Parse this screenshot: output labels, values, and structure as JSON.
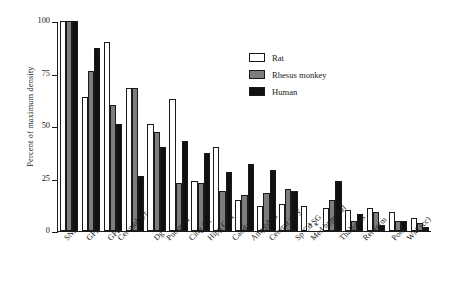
{
  "chart_data": {
    "type": "bar",
    "title": "",
    "xlabel": "",
    "ylabel": "Percent of maximum density",
    "ylim": [
      0,
      100
    ],
    "yticks": [
      0,
      25,
      50,
      75,
      100
    ],
    "grid": false,
    "legend_position": "top-right",
    "missing_marker": "*",
    "categories": [
      "SNr",
      "GPi",
      "GPe",
      "Cer mol lyr",
      "Dg",
      "Putamen",
      "Cing Cx",
      "Hipp CA1",
      "Caudate",
      "Amygdala",
      "Central gray",
      "Sp Cd SG",
      "Med hypothal",
      "Thalamus",
      "Ret form",
      "Pons",
      "WM (cc)"
    ],
    "series": [
      {
        "name": "Rat",
        "color": "#ffffff",
        "values": [
          100,
          64,
          90,
          68,
          51,
          63,
          24,
          40,
          15,
          12,
          13,
          12,
          11,
          10,
          11,
          9,
          6
        ]
      },
      {
        "name": "Rhesus monkey",
        "color": "#7d7d7d",
        "values": [
          100,
          76,
          60,
          68,
          47,
          23,
          23,
          19,
          17,
          18,
          20,
          null,
          15,
          5,
          9,
          5,
          4
        ]
      },
      {
        "name": "Human",
        "color": "#101010",
        "values": [
          100,
          87,
          51,
          26,
          40,
          43,
          37,
          28,
          32,
          29,
          19,
          null,
          24,
          8,
          3,
          5,
          2
        ]
      }
    ]
  },
  "legend": {
    "entries": [
      {
        "label": "Rat",
        "swatch": "rat"
      },
      {
        "label": "Rhesus monkey",
        "swatch": "monkey"
      },
      {
        "label": "Human",
        "swatch": "human"
      }
    ]
  },
  "axes": {
    "y_title": "Percent of maximum density",
    "y_tick_labels": [
      "100",
      "75",
      "50",
      "25",
      "0"
    ]
  }
}
